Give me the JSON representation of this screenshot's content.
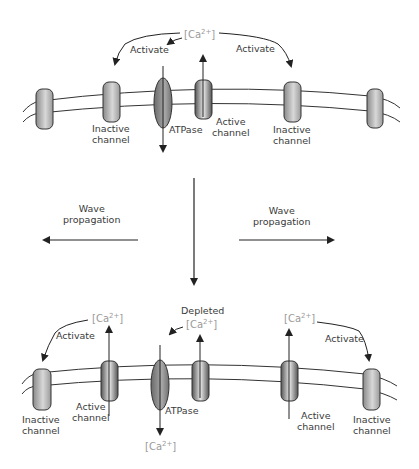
{
  "figure": {
    "top_panel": {
      "ca_label": "[Ca",
      "ca_sup": "2+",
      "ca_close": "]",
      "activate_left": "Activate",
      "activate_right": "Activate",
      "atpase": "ATPase",
      "active_channel": "Active\nchannel",
      "inactive_left": "Inactive\nchannel",
      "inactive_right": "Inactive\nchannel"
    },
    "middle": {
      "wave_left": "Wave\npropagation",
      "wave_right": "Wave\npropagation"
    },
    "bottom_panel": {
      "ca_left": "[Ca",
      "ca_right": "[Ca",
      "ca_bottom": "[Ca",
      "ca_depleted": "[Ca",
      "ca_sup": "2+",
      "ca_close": "]",
      "depleted": "Depleted",
      "activate_left": "Activate",
      "activate_right": "Activate",
      "atpase": "ATPase",
      "active_left": "Active\nchannel",
      "active_right": "Active\nchannel",
      "inactive_left": "Inactive\nchannel",
      "inactive_right": "Inactive\nchannel"
    },
    "colors": {
      "line": "#2a2a2a",
      "ca_text": "#9a9a9a",
      "channel_inactive": "#b5b5b5",
      "channel_active": "#7a7a7a"
    }
  }
}
